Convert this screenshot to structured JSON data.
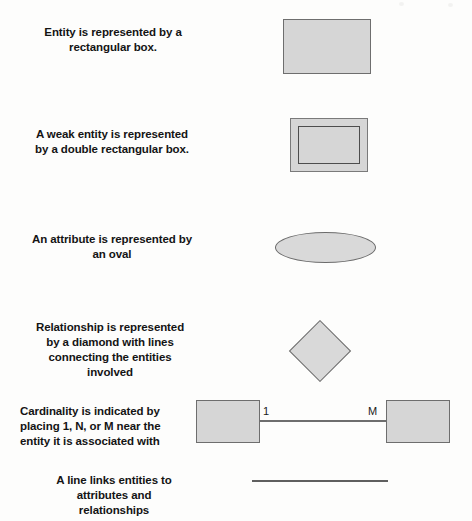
{
  "page": {
    "background_color": "#fdfdfc",
    "shape_fill_color": "#d6d6d6",
    "shape_stroke_color": "#6e6e6e",
    "text_color": "#141414"
  },
  "rows": [
    {
      "id": "entity",
      "caption_lines": [
        "Entity is represented by a",
        "rectangular box."
      ],
      "align": "centered",
      "symbol": "rectangle"
    },
    {
      "id": "weak-entity",
      "caption_lines": [
        "A weak entity is represented",
        "by a double rectangular box."
      ],
      "align": "centered",
      "symbol": "double-rectangle"
    },
    {
      "id": "attribute",
      "caption_lines": [
        "An attribute is represented by",
        "an oval"
      ],
      "align": "centered",
      "symbol": "oval"
    },
    {
      "id": "relationship",
      "caption_lines": [
        "Relationship is represented",
        "by a diamond with lines",
        "connecting the entities",
        "involved"
      ],
      "align": "centered",
      "symbol": "diamond"
    },
    {
      "id": "cardinality",
      "caption_lines": [
        "Cardinality is indicated by",
        "placing 1, N, or M near the",
        "entity it is associated with"
      ],
      "align": "leftward",
      "symbol": "two-boxes-with-line",
      "cardinality_labels": {
        "left": "1",
        "right": "M"
      }
    },
    {
      "id": "line",
      "caption_lines": [
        "A line links entities to",
        "attributes and",
        "relationships"
      ],
      "align": "centered",
      "symbol": "line"
    }
  ]
}
